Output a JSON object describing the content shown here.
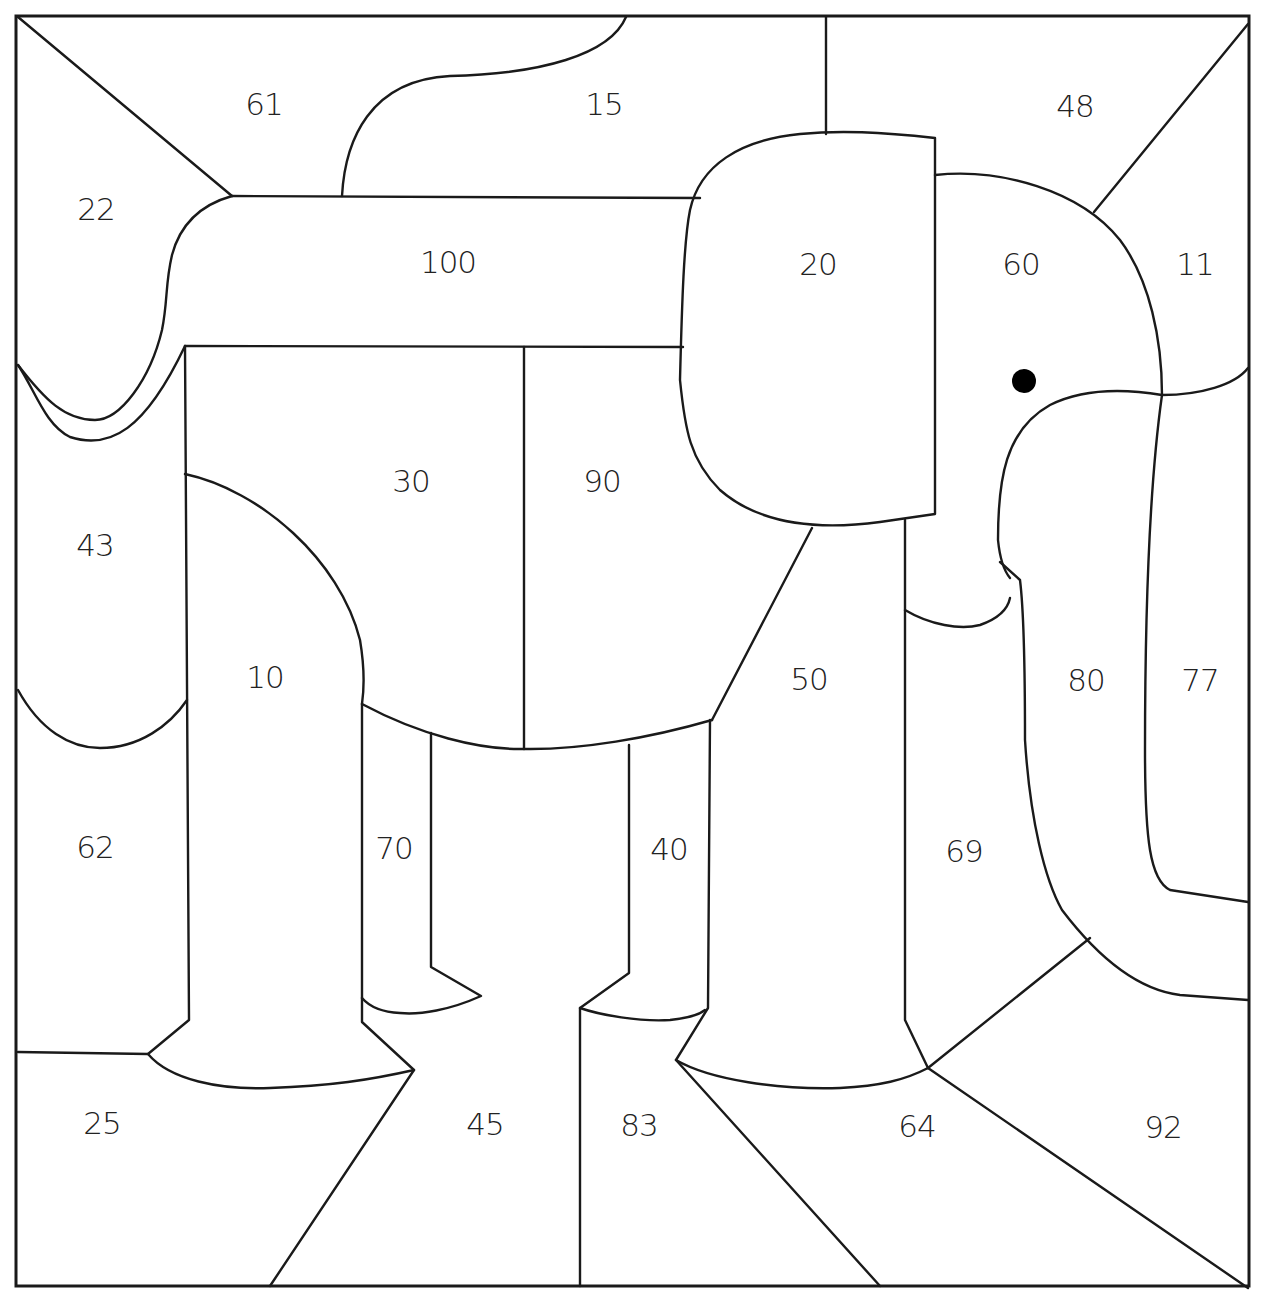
{
  "worksheet": {
    "subject": "elephant",
    "line_color": "#1a1a1a",
    "eye_color": "#000000",
    "regions": [
      {
        "id": "r61",
        "label": "61",
        "area": "sky-top-left"
      },
      {
        "id": "r15",
        "label": "15",
        "area": "sky-top-middle"
      },
      {
        "id": "r48",
        "label": "48",
        "area": "sky-top-right"
      },
      {
        "id": "r22",
        "label": "22",
        "area": "left-upper"
      },
      {
        "id": "r100",
        "label": "100",
        "area": "elephant-back"
      },
      {
        "id": "r20",
        "label": "20",
        "area": "elephant-ear"
      },
      {
        "id": "r60",
        "label": "60",
        "area": "elephant-head"
      },
      {
        "id": "r11",
        "label": "11",
        "area": "right-upper"
      },
      {
        "id": "r43",
        "label": "43",
        "area": "left-middle"
      },
      {
        "id": "r30",
        "label": "30",
        "area": "elephant-body-rear"
      },
      {
        "id": "r90",
        "label": "90",
        "area": "elephant-body-front"
      },
      {
        "id": "r10",
        "label": "10",
        "area": "elephant-back-leg"
      },
      {
        "id": "r50",
        "label": "50",
        "area": "elephant-front-leg"
      },
      {
        "id": "r80",
        "label": "80",
        "area": "elephant-trunk"
      },
      {
        "id": "r77",
        "label": "77",
        "area": "right-middle"
      },
      {
        "id": "r62",
        "label": "62",
        "area": "left-lower"
      },
      {
        "id": "r70",
        "label": "70",
        "area": "elephant-far-back-leg"
      },
      {
        "id": "r40",
        "label": "40",
        "area": "elephant-far-front-leg"
      },
      {
        "id": "r69",
        "label": "69",
        "area": "between-leg-and-trunk"
      },
      {
        "id": "r25",
        "label": "25",
        "area": "ground-left"
      },
      {
        "id": "r45",
        "label": "45",
        "area": "ground-middle-left"
      },
      {
        "id": "r83",
        "label": "83",
        "area": "ground-middle"
      },
      {
        "id": "r64",
        "label": "64",
        "area": "ground-middle-right"
      },
      {
        "id": "r92",
        "label": "92",
        "area": "ground-right"
      }
    ]
  }
}
